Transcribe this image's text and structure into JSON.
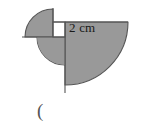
{
  "figure": {
    "fill_color": "#999999",
    "stroke_color": "#555555",
    "notch_color": "#ffffff",
    "background_color": "#ffffff",
    "stroke_width": 1.1,
    "geometry": {
      "center_x": 65,
      "center_y": 37,
      "large_radius": 63,
      "small_radius": 28,
      "square_left": 53,
      "square_top": 22,
      "square_size": 15,
      "top_edge_y": 22,
      "top_edge_right_x": 128,
      "semicircle_bottom_y": 93,
      "small_arc_top_y": 8,
      "small_arc_left_x": 14,
      "left_tick_y": 37
    },
    "labels": {
      "dimension": "2 cm",
      "answer_paren": "("
    }
  }
}
